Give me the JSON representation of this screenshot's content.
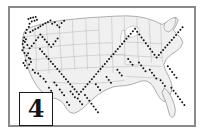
{
  "figure": {
    "number": "4",
    "panel_border_color": "#8a8a8a",
    "background_color": "#ffffff"
  },
  "map": {
    "name": "united-states-map",
    "land_fill": "#f0f0f0",
    "state_border_color": "#9a9a9a",
    "outline_color": "#6e6e6e",
    "marker_color": "#111111",
    "marker_shape": "dot",
    "projection_hint": "contiguous-united-states"
  },
  "chart_data": {
    "type": "scatter",
    "title": "",
    "xlabel": "",
    "ylabel": "",
    "xlim": [
      0,
      1000
    ],
    "ylim": [
      0,
      640
    ],
    "grid": false,
    "legend": null,
    "marker_color": "#111111",
    "series": [
      {
        "name": "sites",
        "points": [
          [
            86,
            48
          ],
          [
            98,
            42
          ],
          [
            112,
            39
          ],
          [
            126,
            36
          ],
          [
            133,
            52
          ],
          [
            120,
            58
          ],
          [
            104,
            62
          ],
          [
            92,
            74
          ],
          [
            88,
            92
          ],
          [
            76,
            108
          ],
          [
            70,
            126
          ],
          [
            96,
            120
          ],
          [
            110,
            112
          ],
          [
            124,
            104
          ],
          [
            140,
            96
          ],
          [
            152,
            88
          ],
          [
            166,
            80
          ],
          [
            180,
            72
          ],
          [
            194,
            64
          ],
          [
            208,
            56
          ],
          [
            218,
            74
          ],
          [
            232,
            66
          ],
          [
            246,
            82
          ],
          [
            258,
            94
          ],
          [
            270,
            70
          ],
          [
            284,
            58
          ],
          [
            62,
            150
          ],
          [
            58,
            168
          ],
          [
            54,
            186
          ],
          [
            66,
            176
          ],
          [
            72,
            160
          ],
          [
            80,
            192
          ],
          [
            60,
            206
          ],
          [
            52,
            222
          ],
          [
            64,
            236
          ],
          [
            76,
            250
          ],
          [
            88,
            264
          ],
          [
            70,
            278
          ],
          [
            58,
            292
          ],
          [
            66,
            306
          ],
          [
            78,
            320
          ],
          [
            90,
            300
          ],
          [
            100,
            286
          ],
          [
            96,
            268
          ],
          [
            84,
            238
          ],
          [
            92,
            210
          ],
          [
            104,
            198
          ],
          [
            116,
            182
          ],
          [
            128,
            166
          ],
          [
            140,
            150
          ],
          [
            152,
            134
          ],
          [
            164,
            148
          ],
          [
            176,
            162
          ],
          [
            188,
            176
          ],
          [
            200,
            190
          ],
          [
            212,
            204
          ],
          [
            224,
            188
          ],
          [
            236,
            172
          ],
          [
            248,
            156
          ],
          [
            150,
            214
          ],
          [
            162,
            228
          ],
          [
            174,
            242
          ],
          [
            186,
            256
          ],
          [
            198,
            270
          ],
          [
            210,
            284
          ],
          [
            222,
            298
          ],
          [
            234,
            312
          ],
          [
            246,
            326
          ],
          [
            258,
            340
          ],
          [
            270,
            354
          ],
          [
            282,
            368
          ],
          [
            294,
            382
          ],
          [
            306,
            396
          ],
          [
            318,
            410
          ],
          [
            330,
            424
          ],
          [
            342,
            438
          ],
          [
            354,
            452
          ],
          [
            366,
            466
          ],
          [
            378,
            452
          ],
          [
            390,
            438
          ],
          [
            402,
            424
          ],
          [
            414,
            410
          ],
          [
            426,
            396
          ],
          [
            438,
            382
          ],
          [
            450,
            368
          ],
          [
            462,
            354
          ],
          [
            474,
            340
          ],
          [
            486,
            326
          ],
          [
            498,
            312
          ],
          [
            510,
            298
          ],
          [
            522,
            284
          ],
          [
            534,
            270
          ],
          [
            546,
            256
          ],
          [
            558,
            242
          ],
          [
            570,
            228
          ],
          [
            582,
            214
          ],
          [
            594,
            200
          ],
          [
            606,
            186
          ],
          [
            618,
            172
          ],
          [
            630,
            158
          ],
          [
            642,
            144
          ],
          [
            654,
            130
          ],
          [
            666,
            116
          ],
          [
            678,
            102
          ],
          [
            690,
            118
          ],
          [
            702,
            134
          ],
          [
            714,
            150
          ],
          [
            726,
            166
          ],
          [
            738,
            182
          ],
          [
            750,
            198
          ],
          [
            762,
            214
          ],
          [
            774,
            230
          ],
          [
            786,
            246
          ],
          [
            798,
            262
          ],
          [
            810,
            248
          ],
          [
            822,
            234
          ],
          [
            834,
            220
          ],
          [
            846,
            206
          ],
          [
            858,
            192
          ],
          [
            870,
            178
          ],
          [
            882,
            164
          ],
          [
            894,
            150
          ],
          [
            906,
            136
          ],
          [
            918,
            122
          ],
          [
            930,
            108
          ],
          [
            942,
            94
          ],
          [
            860,
            310
          ],
          [
            872,
            326
          ],
          [
            884,
            342
          ],
          [
            896,
            358
          ],
          [
            908,
            374
          ],
          [
            820,
            388
          ],
          [
            832,
            404
          ],
          [
            844,
            420
          ],
          [
            760,
            330
          ],
          [
            772,
            346
          ],
          [
            784,
            362
          ],
          [
            796,
            378
          ],
          [
            700,
            290
          ],
          [
            712,
            306
          ],
          [
            724,
            322
          ],
          [
            736,
            338
          ],
          [
            640,
            270
          ],
          [
            652,
            286
          ],
          [
            664,
            302
          ],
          [
            580,
            330
          ],
          [
            592,
            346
          ],
          [
            604,
            362
          ],
          [
            520,
            370
          ],
          [
            532,
            386
          ],
          [
            544,
            402
          ],
          [
            460,
            410
          ],
          [
            472,
            426
          ],
          [
            484,
            442
          ],
          [
            400,
            470
          ],
          [
            412,
            486
          ],
          [
            424,
            502
          ],
          [
            436,
            518
          ],
          [
            448,
            534
          ],
          [
            460,
            550
          ],
          [
            472,
            566
          ],
          [
            360,
            490
          ],
          [
            372,
            506
          ],
          [
            384,
            522
          ],
          [
            320,
            450
          ],
          [
            332,
            466
          ],
          [
            344,
            482
          ],
          [
            300,
            510
          ],
          [
            312,
            526
          ],
          [
            260,
            440
          ],
          [
            272,
            456
          ],
          [
            284,
            472
          ],
          [
            230,
            400
          ],
          [
            242,
            416
          ],
          [
            200,
            430
          ],
          [
            212,
            446
          ],
          [
            170,
            380
          ],
          [
            182,
            396
          ],
          [
            140,
            350
          ],
          [
            152,
            366
          ],
          [
            110,
            330
          ],
          [
            122,
            346
          ],
          [
            880,
            430
          ],
          [
            892,
            446
          ],
          [
            904,
            462
          ],
          [
            916,
            478
          ],
          [
            928,
            494
          ],
          [
            940,
            510
          ],
          [
            952,
            526
          ]
        ]
      }
    ]
  }
}
